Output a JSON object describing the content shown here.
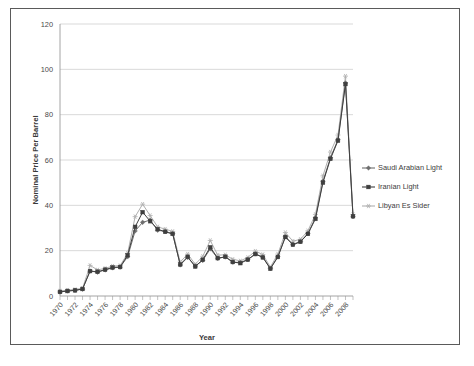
{
  "chart_data": {
    "type": "line",
    "title": "",
    "xlabel": "Year",
    "ylabel": "Nominal Price Per Barrel",
    "xlim": [
      1970,
      2009
    ],
    "ylim": [
      0,
      120
    ],
    "ytick_step": 20,
    "yticks": [
      0,
      20,
      40,
      60,
      80,
      100,
      120
    ],
    "xtick_labels": [
      "1970",
      "1972",
      "1974",
      "1976",
      "1978",
      "1980",
      "1982",
      "1984",
      "1986",
      "1988",
      "1990",
      "1992",
      "1994",
      "1996",
      "1998",
      "2000",
      "2002",
      "2004",
      "2006",
      "2008"
    ],
    "x": [
      1970,
      1971,
      1972,
      1973,
      1974,
      1975,
      1976,
      1977,
      1978,
      1979,
      1980,
      1981,
      1982,
      1983,
      1984,
      1985,
      1986,
      1987,
      1988,
      1989,
      1990,
      1991,
      1992,
      1993,
      1994,
      1995,
      1996,
      1997,
      1998,
      1999,
      2000,
      2001,
      2002,
      2003,
      2004,
      2005,
      2006,
      2007,
      2008,
      2009
    ],
    "grid": true,
    "legend_position": "right",
    "series": [
      {
        "name": "Saudi Arabian Light",
        "color": "#6e6e6e",
        "marker": "diamond",
        "values": [
          1.8,
          2.2,
          2.5,
          3.0,
          11.0,
          10.5,
          11.5,
          12.4,
          12.7,
          17.3,
          28.7,
          32.5,
          33.5,
          29.0,
          28.5,
          27.5,
          13.7,
          17.0,
          13.2,
          15.7,
          20.8,
          16.6,
          17.2,
          14.9,
          14.8,
          16.1,
          18.6,
          17.2,
          12.2,
          17.4,
          26.2,
          22.8,
          24.0,
          27.6,
          34.5,
          50.6,
          61.0,
          69.0,
          94.0,
          35.0
        ]
      },
      {
        "name": "Iranian Light",
        "color": "#3f3f3f",
        "marker": "square",
        "values": [
          1.8,
          2.2,
          2.5,
          3.1,
          11.0,
          10.7,
          11.6,
          12.6,
          12.8,
          18.0,
          30.5,
          37.0,
          33.0,
          29.5,
          28.3,
          27.4,
          13.9,
          17.3,
          13.0,
          16.0,
          21.5,
          16.7,
          17.3,
          15.0,
          14.5,
          16.0,
          18.5,
          17.0,
          12.0,
          17.2,
          26.0,
          22.6,
          23.9,
          27.4,
          34.0,
          50.0,
          60.5,
          68.5,
          93.5,
          35.2
        ]
      },
      {
        "name": "Libyan Es Sider",
        "color": "#b0b0b0",
        "marker": "star",
        "values": [
          2.2,
          2.6,
          2.9,
          3.4,
          13.5,
          11.5,
          12.2,
          13.2,
          13.4,
          18.8,
          35.0,
          40.5,
          35.5,
          30.5,
          29.5,
          28.5,
          15.0,
          18.5,
          14.0,
          17.5,
          24.5,
          18.0,
          18.2,
          16.2,
          15.5,
          17.0,
          19.8,
          18.3,
          12.8,
          18.5,
          28.0,
          24.2,
          25.0,
          28.8,
          36.0,
          53.0,
          63.5,
          71.0,
          97.0,
          36.0
        ]
      }
    ]
  },
  "legend": {
    "items": [
      {
        "label": "Saudi Arabian Light"
      },
      {
        "label": "Iranian Light"
      },
      {
        "label": "Libyan Es Sider"
      }
    ]
  }
}
